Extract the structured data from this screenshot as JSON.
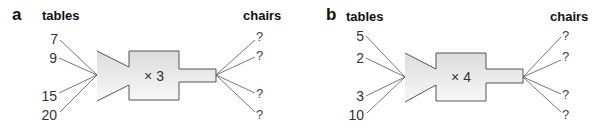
{
  "panels": [
    {
      "label": "a",
      "input_header": "tables",
      "output_header": "chairs",
      "operation": "× 3",
      "inputs": [
        "7",
        "9",
        "15",
        "20"
      ],
      "outputs": [
        "?",
        "?",
        "?",
        "?"
      ]
    },
    {
      "label": "b",
      "input_header": "tables",
      "output_header": "chairs",
      "operation": "× 4",
      "inputs": [
        "5",
        "2",
        "3",
        "10"
      ],
      "outputs": [
        "?",
        "?",
        "?",
        "?"
      ]
    }
  ],
  "colors": {
    "machine_fill_top": "#e6e6e6",
    "machine_fill_bottom": "#f7f7f7",
    "line": "#555555"
  }
}
